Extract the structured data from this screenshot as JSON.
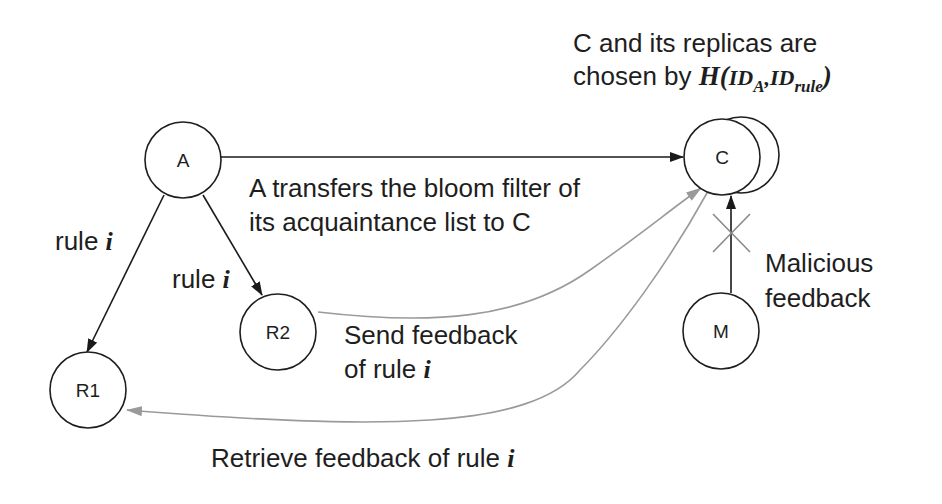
{
  "title_note": {
    "line1": "C and its replicas are",
    "line2_prefix": "chosen by ",
    "hash_fn": "H(",
    "id_a": "ID",
    "id_a_sub": "A",
    "sep": ",",
    "id_rule": "ID",
    "id_rule_sub": "rule",
    "close": ")"
  },
  "nodes": [
    {
      "id": "A",
      "label": "A",
      "cx": 183,
      "cy": 160,
      "r": 38
    },
    {
      "id": "C",
      "label": "C",
      "cx": 722,
      "cy": 157,
      "r": 38,
      "replica": {
        "cx": 741,
        "cy": 155,
        "r": 38
      }
    },
    {
      "id": "R2",
      "label": "R2",
      "cx": 278,
      "cy": 332,
      "r": 38
    },
    {
      "id": "R1",
      "label": "R1",
      "cx": 88,
      "cy": 390,
      "r": 38
    },
    {
      "id": "M",
      "label": "M",
      "cx": 721,
      "cy": 331,
      "r": 38
    }
  ],
  "edges": [
    {
      "from": "A",
      "to": "C",
      "style": "black",
      "label": "A transfers the bloom filter of its acquaintance list to C"
    },
    {
      "from": "A",
      "to": "R1",
      "style": "black",
      "label": "rule i"
    },
    {
      "from": "A",
      "to": "R2",
      "style": "black",
      "label": "rule i"
    },
    {
      "from": "R2",
      "to": "C",
      "style": "gray",
      "label": "Send feedback of rule i"
    },
    {
      "from": "C",
      "to": "R1",
      "style": "gray",
      "label": "Retrieve feedback of rule i"
    },
    {
      "from": "M",
      "to": "C",
      "style": "black-blocked",
      "label": "Malicious feedback"
    }
  ],
  "labels": {
    "transfer_line1": "A transfers the bloom filter of",
    "transfer_line2": "its acquaintance list to C",
    "rule_r1_text": "rule ",
    "rule_r1_var": "i",
    "rule_r2_text": "rule ",
    "rule_r2_var": "i",
    "send_line1": "Send feedback",
    "send_line2_text": "of rule ",
    "send_line2_var": "i",
    "malicious_line1": "Malicious",
    "malicious_line2": "feedback",
    "retrieve_text": "Retrieve feedback of rule ",
    "retrieve_var": "i"
  },
  "colors": {
    "black_edge": "#1a1a1a",
    "gray_edge": "#9a9a9a",
    "node_stroke": "#1e1e1e"
  }
}
